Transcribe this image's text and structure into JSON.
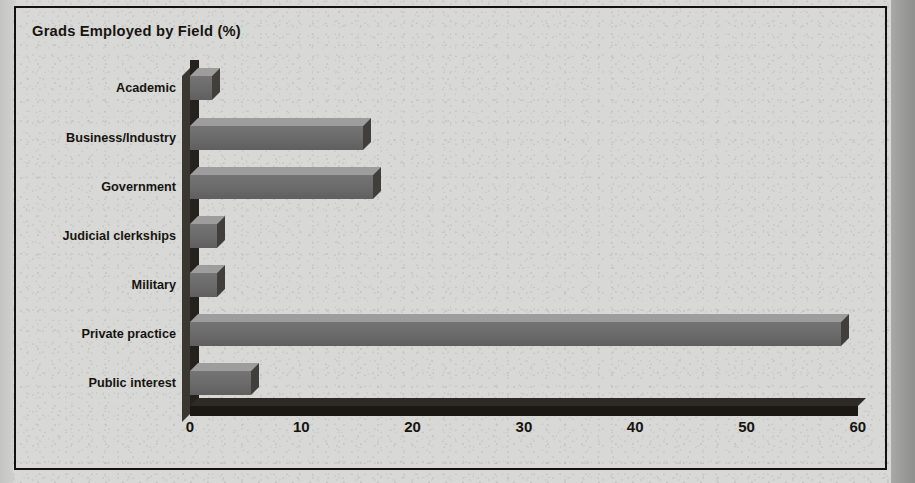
{
  "chart": {
    "title": "Grads Employed by Field (%)",
    "axis_min_x_px": 190,
    "px_per_unit": 11.13
  },
  "chart_data": {
    "type": "bar",
    "orientation": "horizontal",
    "style": "3d",
    "title": "Grads Employed by Field (%)",
    "xlabel": "",
    "ylabel": "",
    "xlim": [
      0,
      60
    ],
    "xticks": [
      0,
      10,
      20,
      30,
      40,
      50,
      60
    ],
    "grid": false,
    "legend": false,
    "categories": [
      "Academic",
      "Business/Industry",
      "Government",
      "Judicial clerkships",
      "Military",
      "Private practice",
      "Public interest"
    ],
    "values": [
      2.0,
      15.5,
      16.4,
      2.4,
      2.4,
      58.5,
      5.5
    ],
    "colors": {
      "bar_front": "#6a6a6a",
      "bar_top": "#9d9d9d",
      "bar_side": "#413f3c",
      "axis": "#1b1814",
      "text": "#17140f",
      "background": "#d8d8d6"
    }
  },
  "xticks": [
    {
      "label": "0",
      "value": 0
    },
    {
      "label": "10",
      "value": 10
    },
    {
      "label": "20",
      "value": 20
    },
    {
      "label": "30",
      "value": 30
    },
    {
      "label": "40",
      "value": 40
    },
    {
      "label": "50",
      "value": 50
    },
    {
      "label": "60",
      "value": 60
    }
  ]
}
